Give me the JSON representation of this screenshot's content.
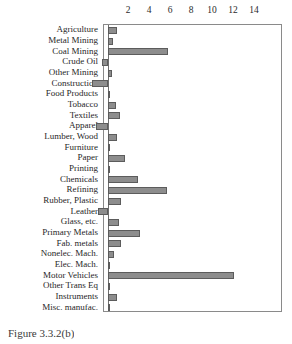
{
  "chart_data": {
    "type": "bar",
    "orientation": "horizontal",
    "title": "",
    "xlabel": "",
    "ylabel": "",
    "xlim": [
      -2.0,
      14.9
    ],
    "xticks": [
      2,
      4,
      6,
      8,
      10,
      12,
      14
    ],
    "grid": false,
    "legend": null,
    "bar_color": "#8d8d8d",
    "bar_edge_color": "#5c5c5c",
    "frame_color": "#8a8a8a",
    "zero_line": 0,
    "categories": [
      "Agriculture",
      "Metal Mining",
      "Coal Mining",
      "Crude Oil",
      "Other Mining",
      "Construction",
      "Food Products",
      "Tobacco",
      "Textiles",
      "Apparel",
      "Lumber, Wood",
      "Furniture",
      "Paper",
      "Printing",
      "Chemicals",
      "Refining",
      "Rubber, Plastic",
      "Leather",
      "Glass, etc.",
      "Primary Metals",
      "Fab. metals",
      "Nonelec. Mach.",
      "Elec. Mach.",
      "Motor Vehicles",
      "Other Trans Eq",
      "Instruments",
      "Misc. manufac."
    ],
    "values": [
      0.9,
      0.5,
      5.7,
      -0.6,
      0.4,
      -1.5,
      0.1,
      0.8,
      1.1,
      -1.1,
      0.9,
      0.2,
      1.6,
      0.1,
      2.9,
      5.6,
      1.2,
      -1.0,
      1.0,
      3.0,
      1.2,
      0.6,
      0.1,
      12.0,
      0.2,
      0.9,
      0.1
    ]
  },
  "caption": {
    "text": "Figure 3.3.2(b)"
  }
}
